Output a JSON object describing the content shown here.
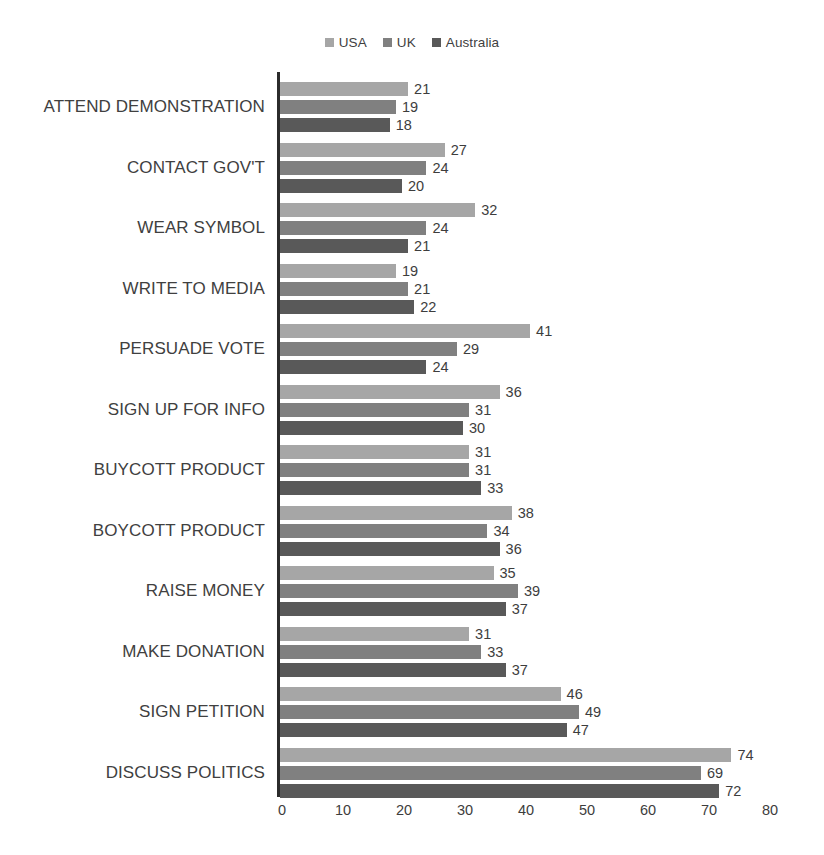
{
  "chart_data": {
    "type": "bar",
    "orientation": "horizontal",
    "title": "",
    "subtitle": "",
    "xlabel": "",
    "ylabel": "",
    "xlim": [
      0,
      80
    ],
    "xticks": [
      0,
      10,
      20,
      30,
      40,
      50,
      60,
      70,
      80
    ],
    "grid": false,
    "legend_position": "top-center",
    "categories": [
      "ATTEND DEMONSTRATION",
      "CONTACT GOV'T",
      "WEAR SYMBOL",
      "WRITE TO MEDIA",
      "PERSUADE VOTE",
      "SIGN UP FOR INFO",
      "BUYCOTT PRODUCT",
      "BOYCOTT PRODUCT",
      "RAISE MONEY",
      "MAKE DONATION",
      "SIGN PETITION",
      "DISCUSS POLITICS"
    ],
    "series": [
      {
        "name": "USA",
        "color": "#a6a6a6",
        "values": [
          21,
          27,
          32,
          19,
          41,
          36,
          31,
          38,
          35,
          31,
          46,
          74
        ]
      },
      {
        "name": "UK",
        "color": "#808080",
        "values": [
          19,
          24,
          24,
          21,
          29,
          31,
          31,
          34,
          39,
          33,
          49,
          69
        ]
      },
      {
        "name": "Australia",
        "color": "#595959",
        "values": [
          18,
          20,
          21,
          22,
          24,
          30,
          33,
          36,
          37,
          37,
          47,
          72
        ]
      }
    ]
  },
  "legend": {
    "entries": [
      {
        "label": "USA",
        "color": "#a6a6a6"
      },
      {
        "label": "UK",
        "color": "#808080"
      },
      {
        "label": "Australia",
        "color": "#595959"
      }
    ]
  },
  "axis": {
    "tick_labels": [
      "0",
      "10",
      "20",
      "30",
      "40",
      "50",
      "60",
      "70",
      "80"
    ]
  },
  "colors": {
    "axis_line": "#2b2b2b",
    "text": "#404040",
    "background": "#ffffff"
  }
}
